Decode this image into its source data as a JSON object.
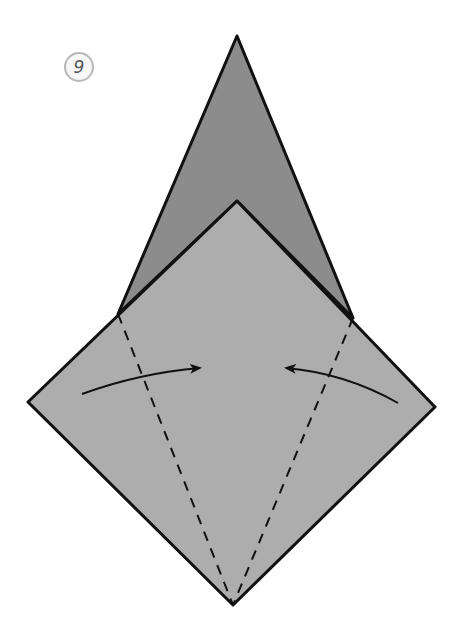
{
  "diagram": {
    "type": "origami-instruction-step",
    "step_number": "9",
    "colors": {
      "back_flap": "#8c8c8c",
      "front_square": "#adadad",
      "outline": "#111111",
      "fold_line": "#111111",
      "arrow": "#111111",
      "step_circle_border": "#b8b8b8",
      "step_circle_text": "#555555"
    },
    "shapes": {
      "back_flap": {
        "description": "tall pointed flap behind the square",
        "points": [
          [
            237,
            36
          ],
          [
            353,
            318
          ],
          [
            237,
            201
          ],
          [
            118,
            314
          ]
        ]
      },
      "front_square": {
        "description": "square (diamond) in front",
        "points": [
          [
            237,
            201
          ],
          [
            435,
            407
          ],
          [
            233,
            605
          ],
          [
            28,
            402
          ]
        ]
      }
    },
    "fold_lines": [
      {
        "name": "left-valley-fold",
        "style": "dashed",
        "from": [
          118,
          314
        ],
        "to": [
          233,
          605
        ]
      },
      {
        "name": "right-valley-fold",
        "style": "dashed",
        "from": [
          353,
          318
        ],
        "to": [
          233,
          605
        ]
      }
    ],
    "arrows": [
      {
        "name": "left-fold-arrow",
        "direction": "right",
        "from": [
          82,
          394
        ],
        "to": [
          200,
          368
        ]
      },
      {
        "name": "right-fold-arrow",
        "direction": "left",
        "from": [
          398,
          403
        ],
        "to": [
          286,
          368
        ]
      }
    ]
  }
}
